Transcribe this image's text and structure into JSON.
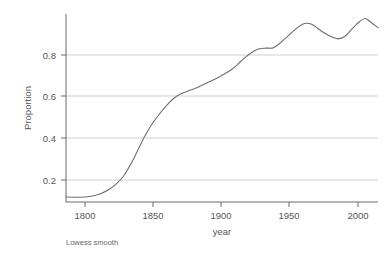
{
  "chart_data": {
    "type": "line",
    "title": "",
    "subtitle": "",
    "xlabel": "year",
    "ylabel": "Proportion",
    "caption": "Lowess smooth",
    "legend": [],
    "legend_position": "none",
    "grid": true,
    "grid_axis": "y",
    "xlim": [
      1790,
      2008
    ],
    "ylim": [
      0.1,
      0.97
    ],
    "xticks": [
      1800,
      1850,
      1900,
      1950,
      2000
    ],
    "xtick_labels": [
      "1800",
      "1850",
      "1900",
      "1950",
      "2000"
    ],
    "yticks": [
      0.2,
      0.4,
      0.6,
      0.8
    ],
    "ytick_labels": [
      "0.2",
      "0.4",
      "0.6",
      "0.8"
    ],
    "line_color": "#6e6e6e",
    "grid_color": "#c9c9c9",
    "axis_color": "#6a6a6a",
    "series": [
      {
        "name": "Lowess smooth",
        "x": [
          1790,
          1795,
          1800,
          1805,
          1810,
          1815,
          1820,
          1825,
          1830,
          1835,
          1840,
          1845,
          1850,
          1855,
          1860,
          1865,
          1870,
          1875,
          1880,
          1885,
          1890,
          1895,
          1900,
          1905,
          1910,
          1915,
          1920,
          1925,
          1930,
          1935,
          1940,
          1945,
          1950,
          1955,
          1958,
          1962,
          1966,
          1970,
          1975,
          1980,
          1985,
          1990,
          1995,
          1999,
          2003,
          2008
        ],
        "values": [
          0.123,
          0.122,
          0.122,
          0.124,
          0.13,
          0.141,
          0.158,
          0.183,
          0.218,
          0.272,
          0.337,
          0.404,
          0.46,
          0.505,
          0.545,
          0.578,
          0.6,
          0.613,
          0.625,
          0.64,
          0.656,
          0.672,
          0.69,
          0.71,
          0.737,
          0.768,
          0.793,
          0.809,
          0.812,
          0.814,
          0.838,
          0.868,
          0.898,
          0.921,
          0.927,
          0.921,
          0.903,
          0.884,
          0.866,
          0.855,
          0.867,
          0.902,
          0.934,
          0.949,
          0.932,
          0.907
        ]
      }
    ]
  },
  "axes": {
    "y_axis_label": "Proportion",
    "x_axis_label": "year"
  },
  "footer": {
    "caption": "Lowess smooth"
  }
}
